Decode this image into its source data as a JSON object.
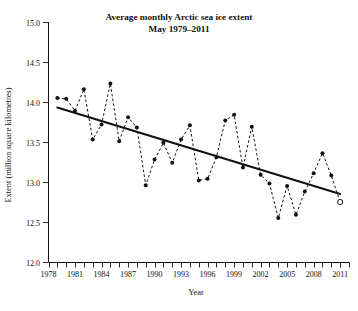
{
  "chart_data": {
    "type": "line",
    "title": "Average monthly Arctic sea ice extent",
    "subtitle": "May 1979–2011",
    "xlabel": "Year",
    "ylabel": "Extent (million square kilometres)",
    "xlim": [
      1978,
      2012
    ],
    "ylim": [
      12.0,
      15.0
    ],
    "grid": false,
    "legend": null,
    "x_ticks_major": [
      1978,
      1981,
      1984,
      1987,
      1990,
      1993,
      1996,
      1999,
      2002,
      2005,
      2008,
      2011
    ],
    "x_tick_labels": [
      "1978",
      "1981",
      "1984",
      "1987",
      "1990",
      "1993",
      "1996",
      "1999",
      "2002",
      "2005",
      "2008",
      "2011"
    ],
    "x_ticks_all": [
      1978,
      1979,
      1980,
      1981,
      1982,
      1983,
      1984,
      1985,
      1986,
      1987,
      1988,
      1989,
      1990,
      1991,
      1992,
      1993,
      1994,
      1995,
      1996,
      1997,
      1998,
      1999,
      2000,
      2001,
      2002,
      2003,
      2004,
      2005,
      2006,
      2007,
      2008,
      2009,
      2010,
      2011,
      2012
    ],
    "y_ticks": [
      12.0,
      12.5,
      13.0,
      13.5,
      14.0,
      14.5,
      15.0
    ],
    "y_tick_labels": [
      "12.0",
      "12.5",
      "13.0",
      "13.5",
      "14.0",
      "14.5",
      "15.0"
    ],
    "series": [
      {
        "name": "May Arctic sea ice extent",
        "marker": "filled-circle",
        "linestyle": "dashed",
        "x": [
          1979,
          1980,
          1981,
          1982,
          1983,
          1984,
          1985,
          1986,
          1987,
          1988,
          1989,
          1990,
          1991,
          1992,
          1993,
          1994,
          1995,
          1996,
          1997,
          1998,
          1999,
          2000,
          2001,
          2002,
          2003,
          2004,
          2005,
          2006,
          2007,
          2008,
          2009,
          2010,
          2011
        ],
        "values": [
          14.05,
          14.04,
          13.89,
          14.16,
          13.53,
          13.72,
          14.23,
          13.51,
          13.81,
          13.68,
          12.96,
          13.28,
          13.49,
          13.24,
          13.53,
          13.71,
          13.02,
          13.04,
          13.31,
          13.77,
          13.84,
          13.18,
          13.69,
          13.09,
          12.98,
          12.55,
          12.95,
          12.59,
          12.88,
          13.11,
          13.36,
          13.08,
          12.75
        ]
      }
    ],
    "highlight_point": {
      "label": "2011",
      "x": 2011,
      "y": 12.75,
      "marker": "open-circle"
    },
    "trend_line": {
      "name": "linear trend",
      "x_start": 1979,
      "y_start": 13.93,
      "x_end": 2011,
      "y_end": 12.85
    }
  }
}
